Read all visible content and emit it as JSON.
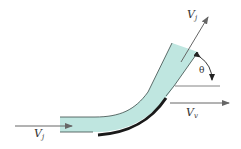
{
  "diagram": {
    "colors": {
      "jet_fill": "#bfe6e0",
      "jet_edge": "#3a4a48",
      "vane": "#1a1a1a",
      "arrow": "#666666",
      "text": "#333333"
    },
    "labels": {
      "inlet_velocity": {
        "main": "V",
        "sub": "j"
      },
      "outlet_velocity": {
        "main": "V",
        "sub": "j"
      },
      "vane_velocity": {
        "main": "V",
        "sub": "v"
      },
      "angle": "θ"
    }
  }
}
